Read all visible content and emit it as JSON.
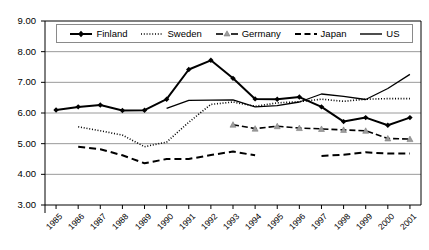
{
  "chart_data": {
    "type": "line",
    "title": "",
    "xlabel": "",
    "ylabel": "",
    "categories": [
      "1985",
      "1986",
      "1987",
      "1988",
      "1989",
      "1990",
      "1991",
      "1992",
      "1993",
      "1994",
      "1995",
      "1996",
      "1997",
      "1998",
      "1999",
      "2000",
      "2001"
    ],
    "ylim": [
      3.0,
      9.0
    ],
    "ytick_step": 1.0,
    "ytick_labels": [
      "9.00",
      "8.00",
      "7.00",
      "6.00",
      "5.00",
      "4.00",
      "3.00"
    ],
    "ytick_values": [
      9.0,
      8.0,
      7.0,
      6.0,
      5.0,
      4.0,
      3.0
    ],
    "grid": true,
    "grid_axis": "y",
    "legend_position": "top-inside",
    "series": [
      {
        "name": "Finland",
        "style": "solid",
        "marker": "diamond",
        "color": "#000000",
        "values": [
          6.1,
          6.2,
          6.26,
          6.08,
          6.09,
          6.45,
          7.42,
          7.72,
          7.13,
          6.46,
          6.45,
          6.52,
          6.2,
          5.72,
          5.85,
          5.6,
          5.85
        ]
      },
      {
        "name": "Sweden",
        "style": "dotted",
        "marker": "none",
        "color": "#000000",
        "values": [
          null,
          5.55,
          5.42,
          5.28,
          4.9,
          5.05,
          5.7,
          6.28,
          6.36,
          6.22,
          6.33,
          6.37,
          6.45,
          6.38,
          6.45,
          6.47,
          6.47
        ]
      },
      {
        "name": "Germany",
        "style": "dashdot",
        "marker": "triangle",
        "color": "#000000",
        "values": [
          null,
          null,
          null,
          null,
          null,
          null,
          null,
          null,
          5.62,
          5.49,
          5.57,
          5.51,
          5.48,
          5.45,
          5.42,
          5.17,
          5.15
        ]
      },
      {
        "name": "Japan",
        "style": "dashed",
        "marker": "none",
        "color": "#000000",
        "values": [
          null,
          4.9,
          4.82,
          4.62,
          4.36,
          4.5,
          4.5,
          4.63,
          4.74,
          4.62,
          null,
          null,
          4.6,
          4.64,
          4.72,
          4.68,
          4.68
        ]
      },
      {
        "name": "US",
        "style": "solid-thin",
        "marker": "none",
        "color": "#000000",
        "values": [
          null,
          null,
          null,
          null,
          null,
          6.15,
          6.41,
          6.42,
          6.43,
          6.2,
          6.24,
          6.36,
          6.62,
          6.54,
          6.44,
          6.8,
          7.26
        ]
      }
    ]
  },
  "legend": {
    "items": [
      {
        "label": "Finland"
      },
      {
        "label": "Sweden"
      },
      {
        "label": "Germany"
      },
      {
        "label": "Japan"
      },
      {
        "label": "US"
      }
    ]
  }
}
